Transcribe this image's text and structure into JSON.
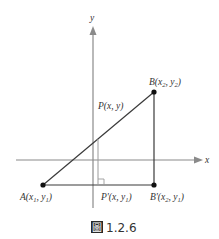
{
  "figure": {
    "caption": {
      "glyph": "圖",
      "number": "1.2.6"
    },
    "axes": {
      "x_label": "x",
      "y_label": "y",
      "color": "#8a8a8a"
    },
    "points": {
      "A": {
        "name": "A",
        "sub": "(x",
        "i1": "1",
        "mid": ", y",
        "i2": "1",
        "end": ")"
      },
      "B": {
        "name": "B",
        "sub": "(x",
        "i1": "2",
        "mid": ", y",
        "i2": "2",
        "end": ")"
      },
      "P": {
        "text": "P(x, y)"
      },
      "Pp": {
        "name": "P'",
        "sub": "(x, y",
        "i2": "1",
        "end": ")"
      },
      "Bp": {
        "name": "B'",
        "sub": "(x",
        "i1": "2",
        "mid": ", y",
        "i2": "1",
        "end": ")"
      }
    },
    "colors": {
      "line": "#3a3a3a",
      "point": "#111111",
      "guide": "#9a9a9a"
    }
  }
}
